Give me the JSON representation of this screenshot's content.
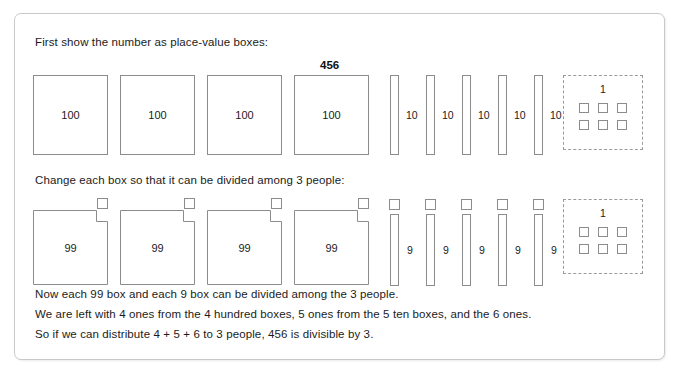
{
  "figure": {
    "number": "456",
    "divisor": 3,
    "line_top": "First show the number as place-value boxes:",
    "line_middle": "Change each box so that it can be divided among 3 people:",
    "line_bottom_1": "Now each 99 box and each 9 box can be divided among the 3 people.",
    "line_bottom_2": "We are left with 4 ones from the 4 hundred boxes, 5 ones from the 5 ten boxes, and the 6 ones.",
    "line_bottom_3": "So if we can distribute 4 + 5 + 6 to 3 people, 456 is divisible by 3.",
    "colors": {
      "frame_border": "#c9c9c9",
      "shape_stroke": "#8c8c8c",
      "dashed_stroke": "#9a9a9a",
      "text": "#1b1b1b",
      "background": "#ffffff"
    }
  },
  "row1": {
    "hundreds": [
      {
        "label": "100"
      },
      {
        "label": "100"
      },
      {
        "label": "100"
      },
      {
        "label": "100"
      }
    ],
    "tens": [
      {
        "label": "10"
      },
      {
        "label": "10"
      },
      {
        "label": "10"
      },
      {
        "label": "10"
      },
      {
        "label": "10"
      }
    ],
    "ones": {
      "label": "1",
      "count": 6,
      "squares": [
        "1",
        "1",
        "1",
        "1",
        "1",
        "1"
      ]
    }
  },
  "row2": {
    "hundreds": [
      {
        "label": "99",
        "cut": "1"
      },
      {
        "label": "99",
        "cut": "1"
      },
      {
        "label": "99",
        "cut": "1"
      },
      {
        "label": "99",
        "cut": "1"
      }
    ],
    "tens": [
      {
        "label": "9",
        "cut": "1"
      },
      {
        "label": "9",
        "cut": "1"
      },
      {
        "label": "9",
        "cut": "1"
      },
      {
        "label": "9",
        "cut": "1"
      },
      {
        "label": "9",
        "cut": "1"
      }
    ],
    "ones": {
      "label": "1",
      "count": 6,
      "squares": [
        "1",
        "1",
        "1",
        "1",
        "1",
        "1"
      ]
    }
  }
}
